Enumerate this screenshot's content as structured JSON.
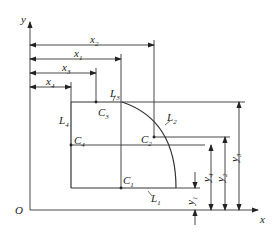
{
  "axes": {
    "x_label": "x",
    "y_label": "y",
    "origin_label": "O"
  },
  "dimensions_x": [
    {
      "name": "x",
      "sub": "2"
    },
    {
      "name": "x",
      "sub": "1"
    },
    {
      "name": "x",
      "sub": "3"
    },
    {
      "name": "x",
      "sub": "4"
    }
  ],
  "dimensions_y": [
    {
      "name": "y",
      "sub": "1"
    },
    {
      "name": "y",
      "sub": "4"
    },
    {
      "name": "y",
      "sub": "2"
    },
    {
      "name": "y",
      "sub": "3"
    }
  ],
  "edges": [
    {
      "name": "L",
      "sub": "1"
    },
    {
      "name": "L",
      "sub": "2"
    },
    {
      "name": "L",
      "sub": "3"
    },
    {
      "name": "L",
      "sub": "4"
    }
  ],
  "centroids": [
    {
      "name": "C",
      "sub": "1"
    },
    {
      "name": "C",
      "sub": "2"
    },
    {
      "name": "C",
      "sub": "3"
    },
    {
      "name": "C",
      "sub": "4"
    }
  ]
}
